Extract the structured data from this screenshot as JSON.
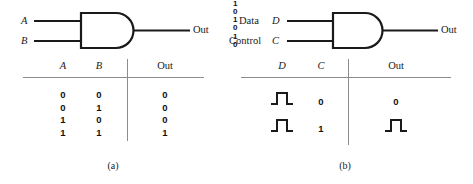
{
  "figure": {
    "type": "logic-gate-diagram",
    "background": "#ffffff",
    "ink": "#1a1a1a",
    "rule_color": "#8c8c8c"
  },
  "panel_a": {
    "caption": "(a)",
    "gate": {
      "kind": "AND",
      "inputs": [
        {
          "label": "A",
          "style": "italic"
        },
        {
          "label": "B",
          "style": "italic"
        }
      ],
      "output": {
        "label": "Out",
        "style": "plain"
      }
    },
    "table": {
      "headers": [
        {
          "text": "A",
          "style": "italic"
        },
        {
          "text": "B",
          "style": "italic"
        },
        {
          "text": "Out",
          "style": "plain"
        }
      ],
      "rows": [
        {
          "A": "0",
          "B": "0",
          "Out": "0"
        },
        {
          "A": "0",
          "B": "1",
          "Out": "0"
        },
        {
          "A": "1",
          "B": "0",
          "Out": "0"
        },
        {
          "A": "1",
          "B": "1",
          "Out": "1"
        }
      ]
    }
  },
  "panel_b": {
    "caption": "(b)",
    "gate": {
      "kind": "AND",
      "inputs": [
        {
          "prefix": "Data",
          "label": "D",
          "style": "italic"
        },
        {
          "prefix": "Control",
          "label": "C",
          "style": "italic"
        }
      ],
      "output": {
        "label": "Out",
        "style": "plain"
      }
    },
    "table": {
      "headers": [
        {
          "text": "D",
          "style": "italic"
        },
        {
          "text": "C",
          "style": "italic"
        },
        {
          "text": "Out",
          "style": "plain"
        }
      ],
      "rows": [
        {
          "D": {
            "kind": "waveform",
            "high_label": "1",
            "low_label": "0",
            "shape": "pulse"
          },
          "C": {
            "kind": "value",
            "text": "0"
          },
          "Out": {
            "kind": "value",
            "text": "0"
          }
        },
        {
          "D": {
            "kind": "waveform",
            "high_label": "1",
            "low_label": "0",
            "shape": "pulse"
          },
          "C": {
            "kind": "value",
            "text": "1"
          },
          "Out": {
            "kind": "waveform",
            "high_label": "1",
            "low_label": "0",
            "shape": "pulse"
          }
        }
      ]
    }
  }
}
